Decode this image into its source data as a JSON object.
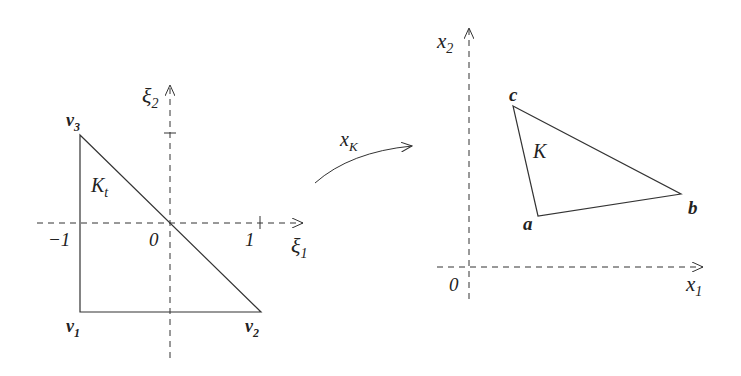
{
  "reference_element": {
    "name": "K_t",
    "name_main": "K",
    "name_sub": "t",
    "axis_x": {
      "main": "ξ",
      "sub": "1"
    },
    "axis_y": {
      "main": "ξ",
      "sub": "2"
    },
    "ticks": {
      "neg_one": "−1",
      "zero": "0",
      "one": "1"
    },
    "vertices": [
      {
        "main": "v",
        "sub": "1"
      },
      {
        "main": "v",
        "sub": "2"
      },
      {
        "main": "v",
        "sub": "3"
      }
    ]
  },
  "mapping": {
    "main": "x",
    "sub": "K"
  },
  "physical_element": {
    "name": "K",
    "axis_x": {
      "main": "x",
      "sub": "1"
    },
    "axis_y": {
      "main": "x",
      "sub": "2"
    },
    "origin": "0",
    "vertices": {
      "a": "a",
      "b": "b",
      "c": "c"
    }
  },
  "colors": {
    "stroke": "#333333",
    "text": "#222222"
  }
}
